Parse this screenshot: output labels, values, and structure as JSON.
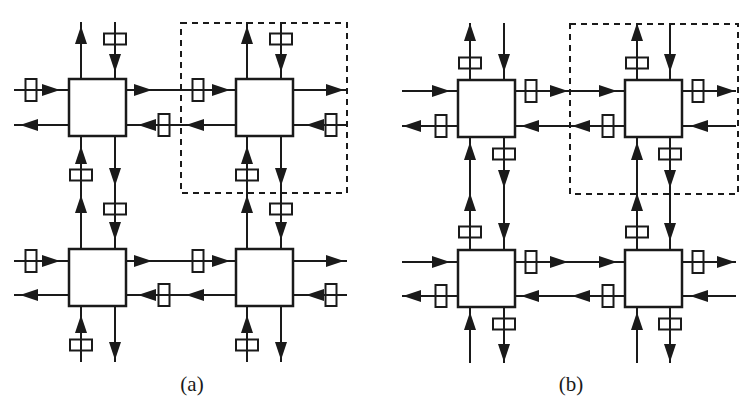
{
  "colors": {
    "stroke": "#1a1a1a",
    "background": "#ffffff"
  },
  "panels": [
    {
      "id": "a",
      "caption": "(a)",
      "caption_x": 162,
      "buffer_placement": "input",
      "routers": [
        {
          "x": 69,
          "y": 79
        },
        {
          "x": 236,
          "y": 79
        },
        {
          "x": 69,
          "y": 249
        },
        {
          "x": 236,
          "y": 249
        }
      ],
      "highlight_box": {
        "x": 181,
        "y": 23,
        "w": 166,
        "h": 170,
        "style": "dashed"
      },
      "h_lanes": [
        {
          "y": 90,
          "dir": "right",
          "x1": 14,
          "x2": 347,
          "arrows": [
            60,
            152,
            230,
            344
          ],
          "buffers": [
            31,
            198
          ]
        },
        {
          "y": 125,
          "dir": "left",
          "x1": 14,
          "x2": 347,
          "arrows": [
            20,
            138,
            186,
            306
          ],
          "buffers": [
            164,
            331
          ]
        },
        {
          "y": 261,
          "dir": "right",
          "x1": 14,
          "x2": 347,
          "arrows": [
            60,
            152,
            230,
            344
          ],
          "buffers": [
            31,
            198
          ]
        },
        {
          "y": 295,
          "dir": "left",
          "x1": 14,
          "x2": 347,
          "arrows": [
            20,
            138,
            186,
            306
          ],
          "buffers": [
            164,
            331
          ]
        }
      ],
      "v_lanes": [
        {
          "x": 81,
          "dir": "up",
          "y1": 22,
          "y2": 362,
          "arrows": [
            26,
            146,
            195,
            315
          ],
          "buffers": [
            175,
            345
          ]
        },
        {
          "x": 115,
          "dir": "down",
          "y1": 22,
          "y2": 362,
          "arrows": [
            72,
            186,
            240,
            360
          ],
          "buffers": [
            39,
            209
          ]
        },
        {
          "x": 247,
          "dir": "up",
          "y1": 22,
          "y2": 362,
          "arrows": [
            26,
            146,
            195,
            315
          ],
          "buffers": [
            175,
            345
          ]
        },
        {
          "x": 281,
          "dir": "down",
          "y1": 22,
          "y2": 362,
          "arrows": [
            72,
            186,
            240,
            360
          ],
          "buffers": [
            39,
            209
          ]
        }
      ]
    },
    {
      "id": "b",
      "caption": "(b)",
      "caption_x": 541,
      "buffer_placement": "output",
      "routers": [
        {
          "x": 458,
          "y": 80
        },
        {
          "x": 625,
          "y": 80
        },
        {
          "x": 458,
          "y": 250
        },
        {
          "x": 625,
          "y": 250
        }
      ],
      "highlight_box": {
        "x": 570,
        "y": 24,
        "w": 168,
        "h": 170,
        "style": "dashed"
      },
      "h_lanes": [
        {
          "y": 91,
          "dir": "right",
          "x1": 402,
          "x2": 736,
          "arrows": [
            450,
            568,
            617,
            735
          ],
          "buffers": [
            531,
            698
          ]
        },
        {
          "y": 126,
          "dir": "left",
          "x1": 402,
          "x2": 736,
          "arrows": [
            403,
            521,
            572,
            690
          ],
          "buffers": [
            441,
            608
          ]
        },
        {
          "y": 262,
          "dir": "right",
          "x1": 402,
          "x2": 736,
          "arrows": [
            450,
            568,
            617,
            735
          ],
          "buffers": [
            531,
            698
          ]
        },
        {
          "y": 296,
          "dir": "left",
          "x1": 402,
          "x2": 736,
          "arrows": [
            403,
            521,
            572,
            690
          ],
          "buffers": [
            441,
            608
          ]
        }
      ],
      "v_lanes": [
        {
          "x": 470,
          "dir": "up",
          "y1": 23,
          "y2": 363,
          "arrows": [
            23,
            142,
            193,
            312
          ],
          "buffers": [
            63,
            232
          ]
        },
        {
          "x": 504,
          "dir": "down",
          "y1": 23,
          "y2": 363,
          "arrows": [
            72,
            188,
            241,
            362
          ],
          "buffers": [
            154,
            324
          ]
        },
        {
          "x": 637,
          "dir": "up",
          "y1": 23,
          "y2": 363,
          "arrows": [
            23,
            142,
            193,
            312
          ],
          "buffers": [
            63,
            232
          ]
        },
        {
          "x": 670,
          "dir": "down",
          "y1": 23,
          "y2": 363,
          "arrows": [
            72,
            188,
            241,
            362
          ],
          "buffers": [
            154,
            324
          ]
        }
      ]
    }
  ],
  "router_size": 57
}
